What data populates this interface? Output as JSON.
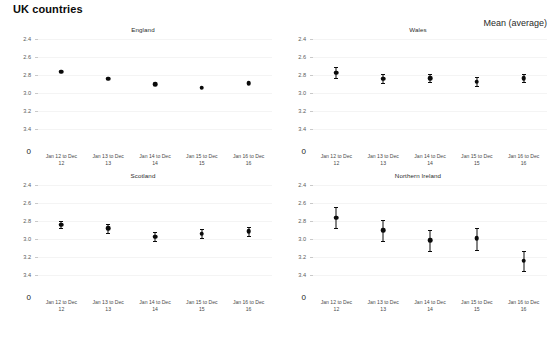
{
  "title": "UK countries",
  "legend": {
    "label": "Mean (average)"
  },
  "axis": {
    "y_ticks": [
      "3.4",
      "3.2",
      "3.0",
      "2.8",
      "2.6",
      "2.4"
    ],
    "zero_label": "0",
    "ylim": [
      2.3,
      3.45
    ]
  },
  "x_categories": [
    {
      "line1": "Jan 12 to Dec",
      "line2": "12"
    },
    {
      "line1": "Jan 13 to Dec",
      "line2": "13"
    },
    {
      "line1": "Jan 14 to Dec",
      "line2": "14"
    },
    {
      "line1": "Jan 15 to Dec",
      "line2": "15"
    },
    {
      "line1": "Jan 16 to Dec",
      "line2": "16"
    }
  ],
  "panels": [
    {
      "key": "england",
      "title": "England"
    },
    {
      "key": "wales",
      "title": "Wales"
    },
    {
      "key": "scotland",
      "title": "Scotland"
    },
    {
      "key": "northern_ireland",
      "title": "Northern Ireland"
    }
  ],
  "chart_data": {
    "type": "scatter",
    "title": "UK countries",
    "xlabel": "",
    "ylabel": "",
    "ylim": [
      2.3,
      3.45
    ],
    "yticks": [
      2.4,
      2.6,
      2.8,
      3.0,
      3.2,
      3.4
    ],
    "grid": true,
    "legend": "Mean (average)",
    "legend_position": "top-right",
    "categories": [
      "Jan 12 to Dec 12",
      "Jan 13 to Dec 13",
      "Jan 14 to Dec 14",
      "Jan 15 to Dec 15",
      "Jan 16 to Dec 16"
    ],
    "panels": [
      {
        "name": "England",
        "values": [
          3.04,
          2.96,
          2.9,
          2.86,
          2.91
        ],
        "err_low": [
          3.04,
          2.96,
          2.9,
          2.86,
          2.91
        ],
        "err_high": [
          3.04,
          2.96,
          2.9,
          2.86,
          2.91
        ]
      },
      {
        "name": "Wales",
        "values": [
          3.03,
          2.96,
          2.97,
          2.93,
          2.97
        ],
        "err_low": [
          2.97,
          2.91,
          2.92,
          2.88,
          2.92
        ],
        "err_high": [
          3.09,
          3.01,
          3.02,
          2.98,
          3.02
        ]
      },
      {
        "name": "Scotland",
        "values": [
          2.96,
          2.92,
          2.83,
          2.86,
          2.89
        ],
        "err_low": [
          2.92,
          2.87,
          2.78,
          2.81,
          2.84
        ],
        "err_high": [
          3.0,
          2.97,
          2.88,
          2.91,
          2.94
        ]
      },
      {
        "name": "Northern Ireland",
        "values": [
          3.04,
          2.9,
          2.79,
          2.81,
          2.56
        ],
        "err_low": [
          2.92,
          2.78,
          2.67,
          2.68,
          2.45
        ],
        "err_high": [
          3.16,
          3.02,
          2.9,
          2.93,
          2.67
        ]
      }
    ]
  }
}
